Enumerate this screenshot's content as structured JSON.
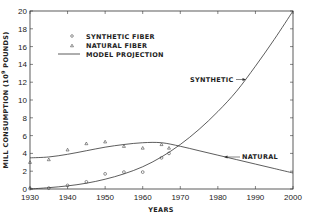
{
  "chart_data": {
    "type": "scatter",
    "title": "",
    "xlabel": "YEARS",
    "ylabel": "MILL CONSUMPTION (10^9 POUNDS)",
    "xlim": [
      1930,
      2000
    ],
    "ylim": [
      0,
      20
    ],
    "x_ticks": [
      1930,
      1940,
      1950,
      1960,
      1970,
      1980,
      1990,
      2000
    ],
    "y_ticks": [
      0,
      2,
      4,
      6,
      8,
      10,
      12,
      14,
      16,
      18,
      20
    ],
    "grid": false,
    "legend_position": "upper-left",
    "legend": [
      {
        "label": "SYNTHETIC FIBER",
        "marker": "circle"
      },
      {
        "label": "NATURAL FIBER",
        "marker": "triangle"
      },
      {
        "label": "MODEL PROJECTION",
        "marker": "line"
      }
    ],
    "series": [
      {
        "name": "SYNTHETIC FIBER",
        "kind": "observed",
        "marker": "circle",
        "x": [
          1930,
          1935,
          1940,
          1945,
          1950,
          1955,
          1960,
          1965,
          1967
        ],
        "values": [
          0.05,
          0.1,
          0.4,
          0.8,
          1.7,
          1.9,
          1.9,
          3.5,
          4.0
        ]
      },
      {
        "name": "NATURAL FIBER",
        "kind": "observed",
        "marker": "triangle",
        "x": [
          1930,
          1935,
          1940,
          1945,
          1950,
          1955,
          1960,
          1965,
          1967
        ],
        "values": [
          3.0,
          3.3,
          4.4,
          5.1,
          5.3,
          4.8,
          4.6,
          5.0,
          4.6
        ]
      },
      {
        "name": "MODEL PROJECTION - SYNTHETIC",
        "kind": "model",
        "x": [
          1930,
          1935,
          1940,
          1945,
          1950,
          1955,
          1960,
          1965,
          1970,
          1975,
          1980,
          1985,
          1990,
          1995,
          2000
        ],
        "values": [
          0.0,
          0.15,
          0.35,
          0.65,
          1.1,
          1.7,
          2.5,
          3.6,
          5.0,
          6.7,
          8.7,
          11.0,
          13.8,
          16.8,
          20.0
        ]
      },
      {
        "name": "MODEL PROJECTION - NATURAL",
        "kind": "model",
        "x": [
          1930,
          1935,
          1940,
          1945,
          1950,
          1955,
          1960,
          1965,
          1970,
          1975,
          1980,
          1985,
          1990,
          1995,
          2000
        ],
        "values": [
          3.5,
          3.6,
          3.9,
          4.3,
          4.7,
          5.0,
          5.2,
          5.2,
          4.8,
          4.3,
          3.8,
          3.3,
          2.8,
          2.3,
          1.8
        ]
      }
    ],
    "annotations": [
      {
        "text": "SYNTHETIC",
        "points_to": "synthetic model curve near 1985"
      },
      {
        "text": "NATURAL",
        "points_to": "natural model curve near 1983"
      }
    ]
  },
  "labels": {
    "xlabel": "YEARS",
    "ylabel_main": "MILL CONSUMPTION (10",
    "ylabel_sup": "9",
    "ylabel_tail": " POUNDS)",
    "legend_synthetic": "SYNTHETIC FIBER",
    "legend_natural": "NATURAL FIBER",
    "legend_model": "MODEL PROJECTION",
    "annot_synthetic": "SYNTHETIC",
    "annot_natural": "NATURAL",
    "x_tick_0": "1930",
    "x_tick_1": "1940",
    "x_tick_2": "1950",
    "x_tick_3": "1960",
    "x_tick_4": "1970",
    "x_tick_5": "1980",
    "x_tick_6": "1990",
    "x_tick_7": "2000",
    "y_tick_0": "0",
    "y_tick_1": "2",
    "y_tick_2": "4",
    "y_tick_3": "6",
    "y_tick_4": "8",
    "y_tick_5": "10",
    "y_tick_6": "12",
    "y_tick_7": "14",
    "y_tick_8": "16",
    "y_tick_9": "18",
    "y_tick_10": "20"
  }
}
